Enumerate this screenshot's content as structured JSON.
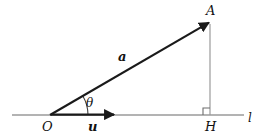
{
  "figure": {
    "type": "geometry-vector-diagram",
    "background_color": "#ffffff",
    "stroke_color_dark": "#1a1a1a",
    "stroke_color_light": "#9a9a9a"
  },
  "labels": {
    "point_A": "A",
    "point_O": "O",
    "point_H": "H",
    "line_l": "l",
    "vector_a": "a",
    "vector_u": "u",
    "angle_theta": "θ"
  },
  "geometry": {
    "origin": {
      "x": 50,
      "y": 115
    },
    "point_A": {
      "x": 210,
      "y": 22
    },
    "point_H": {
      "x": 210,
      "y": 115
    },
    "line_l_start": {
      "x": 12,
      "y": 115
    },
    "line_l_end": {
      "x": 244,
      "y": 115
    },
    "vector_u_end": {
      "x": 116,
      "y": 115
    },
    "angle_arc_radius": 38,
    "right_angle_marker_size": 7
  }
}
